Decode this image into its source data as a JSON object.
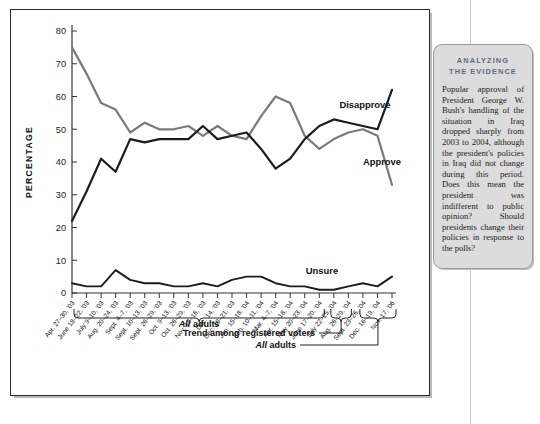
{
  "callout": {
    "title_line1": "ANALYZING",
    "title_line2": "THE EVIDENCE",
    "body": "Popular approval of President George W. Bush's handling of the situation in Iraq dropped sharply from 2003 to 2004, although the president's policies in Iraq did not change during this period. Does this mean the president was indifferent to public opinion? Should presidents change their policies in response to the polls?"
  },
  "annotations": {
    "all_adults_1": "All adults",
    "trend_registered": "Trend among registered voters",
    "all_adults_2": "All adults"
  },
  "chart_data": {
    "type": "line",
    "title": "",
    "xlabel": "",
    "ylabel": "PERCENTAGE",
    "ylim": [
      0,
      80
    ],
    "yticks": [
      0,
      10,
      20,
      30,
      40,
      50,
      60,
      70,
      80
    ],
    "grid": false,
    "legend": "inline-labels",
    "categories": [
      "Apr. 27–30, '03",
      "June 18–22, '03",
      "July 9–10, '03",
      "Aug. 20–24, '03",
      "Sept. 4–7, '03",
      "Sept. 10–13, '03",
      "Sept. 26–29, '03",
      "Oct. 9–13, '03",
      "Oct. 26–29, '03",
      "Nov. 12–16, '03",
      "Dec. 14, '03",
      "Dec. 18–21, '03",
      "Jan. 15–18, '04",
      "Feb. 10–11, '04",
      "Mar. 4–7, '04",
      "Apr. 15–18, '04",
      "May 20–23, '04",
      "June 17–20, '04",
      "July 22–25, '04",
      "Aug. 26–29, '04",
      "Sept. 23–26, '04",
      "Dec. 16–19, '04",
      "Nov. 17, '06"
    ],
    "series": [
      {
        "name": "Approve",
        "color": "#7a7a7a",
        "values": [
          75,
          67,
          58,
          56,
          49,
          52,
          50,
          50,
          51,
          48,
          51,
          48,
          47,
          54,
          60,
          58,
          48,
          44,
          47,
          49,
          50,
          48,
          33
        ]
      },
      {
        "name": "Disapprove",
        "color": "#1c1c1c",
        "values": [
          22,
          31,
          41,
          37,
          47,
          46,
          47,
          47,
          47,
          51,
          47,
          48,
          49,
          44,
          38,
          41,
          47,
          51,
          53,
          52,
          51,
          50,
          62
        ]
      },
      {
        "name": "Unsure",
        "color": "#1c1c1c",
        "values": [
          3,
          2,
          2,
          7,
          4,
          3,
          3,
          2,
          2,
          3,
          2,
          4,
          5,
          5,
          3,
          2,
          2,
          1,
          1,
          2,
          3,
          2,
          5
        ]
      }
    ],
    "series_labels": [
      {
        "name": "Disapprove",
        "x": 355,
        "y": 99
      },
      {
        "name": "Approve",
        "x": 372,
        "y": 156
      },
      {
        "name": "Unsure",
        "x": 312,
        "y": 265
      }
    ]
  }
}
